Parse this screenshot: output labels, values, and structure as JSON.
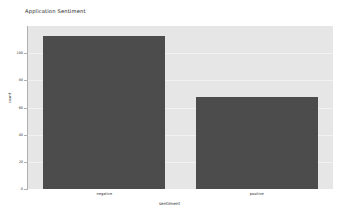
{
  "chart_data": {
    "type": "bar",
    "title": "Application Sentiment",
    "xlabel": "sentiment",
    "ylabel": "count",
    "categories": [
      "negative",
      "positive"
    ],
    "values": [
      113,
      68
    ],
    "ylim": [
      0,
      120
    ],
    "xlim": [
      -0.5,
      1.5
    ],
    "yticks": [
      0,
      20,
      40,
      60,
      80,
      100
    ],
    "ytick_labels": [
      "0",
      "20",
      "40",
      "60",
      "80",
      "100"
    ],
    "grid": true,
    "legend": null,
    "bar_color": "#4c4c4c",
    "plot_background": "#e6e6e6",
    "figure_background": "#ffffff",
    "gridline_color": "#f2f2f2",
    "series": [
      {
        "name": "count",
        "values": [
          113,
          68
        ]
      }
    ]
  }
}
